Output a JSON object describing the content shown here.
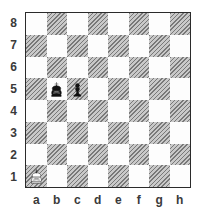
{
  "board": {
    "orientation": "white-bottom",
    "files": [
      "a",
      "b",
      "c",
      "d",
      "e",
      "f",
      "g",
      "h"
    ],
    "ranks": [
      "8",
      "7",
      "6",
      "5",
      "4",
      "3",
      "2",
      "1"
    ],
    "light_square_color": "#fdfdfd",
    "dark_square_color": "#c9c9c9",
    "frame_color": "#2b2b2b",
    "label_color": "#3a3a3a",
    "pieces": [
      {
        "square": "b5",
        "piece": "king",
        "color": "black",
        "glyph": "♚",
        "name": "black-king"
      },
      {
        "square": "c5",
        "piece": "pawn",
        "color": "black",
        "glyph": "♟",
        "name": "black-pawn"
      },
      {
        "square": "a1",
        "piece": "king",
        "color": "white",
        "glyph": "♔",
        "name": "white-king"
      }
    ],
    "fen": "8/8/8/1kp5/8/8/8/K7 w - - 0 1"
  }
}
